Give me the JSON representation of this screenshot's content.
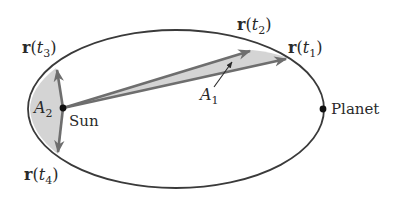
{
  "diagram": {
    "colors": {
      "orbit": "#3a3a3a",
      "vector": "#6e6e6e",
      "shaded_area": "#d4d4d4",
      "dot": "#111111",
      "text": "#2a2a2a"
    },
    "labels": {
      "r_t1": {
        "bold": "r",
        "open": "(",
        "var": "t",
        "sub": "1",
        "close": ")"
      },
      "r_t2": {
        "bold": "r",
        "open": "(",
        "var": "t",
        "sub": "2",
        "close": ")"
      },
      "r_t3": {
        "bold": "r",
        "open": "(",
        "var": "t",
        "sub": "3",
        "close": ")"
      },
      "r_t4": {
        "bold": "r",
        "open": "(",
        "var": "t",
        "sub": "4",
        "close": ")"
      },
      "a1": {
        "var": "A",
        "sub": "1"
      },
      "a2": {
        "var": "A",
        "sub": "2"
      },
      "sun": "Sun",
      "planet": "Planet"
    }
  }
}
